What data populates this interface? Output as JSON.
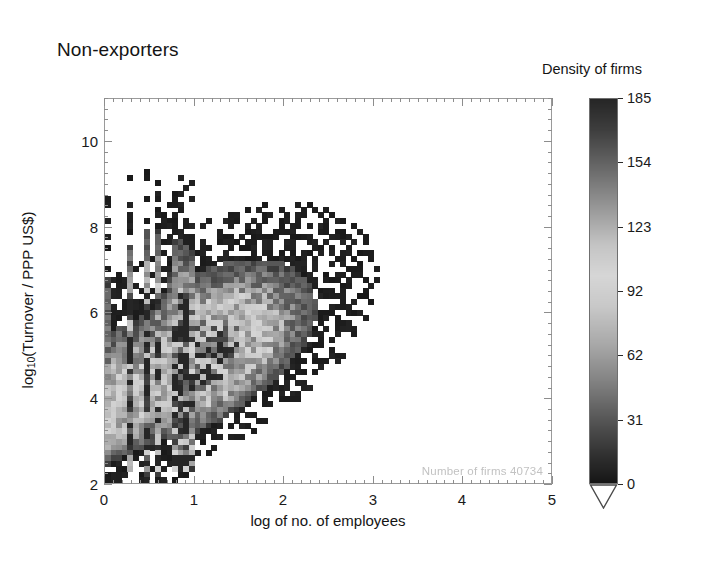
{
  "title": "Non-exporters",
  "in_plot_note": "Number of firms   40734",
  "axes": {
    "x": {
      "label": "log of no. of employees",
      "ticks": [
        "0",
        "1",
        "2",
        "3",
        "4",
        "5"
      ],
      "min": 0,
      "max": 5,
      "minor_step": 0.1
    },
    "y": {
      "label_pre": "log",
      "label_sub": "10",
      "label_post": "(Turnover / PPP US$)",
      "ticks": [
        "2",
        "4",
        "6",
        "8",
        "10"
      ],
      "min": 2,
      "max": 11,
      "minor_step": 0.25
    }
  },
  "colorbar": {
    "title": "Density of firms",
    "ticks": [
      "185",
      "154",
      "123",
      "92",
      "62",
      "31",
      "0"
    ],
    "min": 0,
    "max": 185,
    "under_arrow": true,
    "stops": [
      {
        "pos": 0.0,
        "gray": 38
      },
      {
        "pos": 0.08,
        "gray": 62
      },
      {
        "pos": 0.18,
        "gray": 105
      },
      {
        "pos": 0.28,
        "gray": 150
      },
      {
        "pos": 0.38,
        "gray": 196
      },
      {
        "pos": 0.46,
        "gray": 214
      },
      {
        "pos": 0.54,
        "gray": 200
      },
      {
        "pos": 0.64,
        "gray": 168
      },
      {
        "pos": 0.74,
        "gray": 128
      },
      {
        "pos": 0.84,
        "gray": 84
      },
      {
        "pos": 0.93,
        "gray": 48
      },
      {
        "pos": 1.0,
        "gray": 22
      }
    ]
  },
  "chart_data": {
    "type": "heatmap",
    "title": "Non-exporters",
    "xlabel": "log of no. of employees",
    "ylabel": "log10(Turnover / PPP US$)",
    "zlabel": "Density of firms",
    "xlim": [
      0,
      5
    ],
    "ylim": [
      2,
      11
    ],
    "zlim": [
      0,
      185
    ],
    "grid": false,
    "legend": "colorbar-right",
    "n_firms": 40734,
    "cell_size_data": [
      0.0625,
      0.125
    ],
    "ridge": {
      "description": "principal diagonal band of occupied cells",
      "slope": 1.0,
      "intercept": 3.6,
      "half_width_low": 0.75,
      "half_width_high": 1.15
    },
    "quantised_columns_x": [
      0.0,
      0.301,
      0.477,
      0.602,
      0.699,
      0.778,
      0.845,
      0.903,
      0.954,
      1.0
    ],
    "peak_density_region": {
      "x": [
        0.8,
        1.9
      ],
      "y": [
        4.1,
        6.2
      ],
      "value": 185
    },
    "occupied_extent": {
      "x": [
        0.0,
        4.55
      ],
      "y": [
        2.05,
        9.85
      ]
    }
  }
}
